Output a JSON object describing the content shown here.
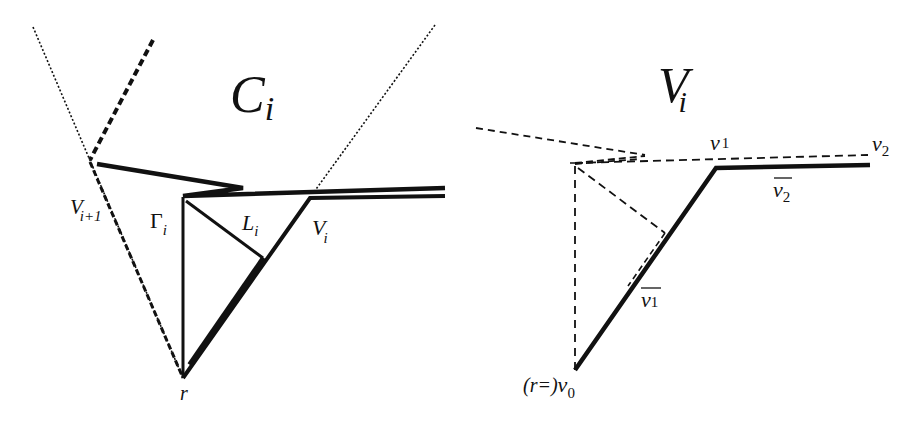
{
  "figure": {
    "left_panel": {
      "region_label": {
        "main": "C",
        "sub": "i"
      },
      "labels": {
        "v_next": {
          "main": "V",
          "sub": "i+1"
        },
        "gamma": {
          "main": "Γ",
          "sub": "i"
        },
        "l": {
          "main": "L",
          "sub": "i"
        },
        "v_i": {
          "main": "V",
          "sub": "i"
        },
        "root": {
          "main": "r"
        }
      }
    },
    "right_panel": {
      "region_label": {
        "main": "V",
        "sub": "i"
      },
      "labels": {
        "v1": {
          "main": "v",
          "sub": "1"
        },
        "v2": {
          "main": "v",
          "sub": "2"
        },
        "v1bar": {
          "main": "v",
          "sub": "1"
        },
        "v2bar": {
          "main": "v",
          "sub": "2"
        },
        "v0": {
          "prefix": "(r=)",
          "main": "v",
          "sub": "0"
        }
      }
    },
    "colors": {
      "ink": "#111111",
      "background": "#ffffff"
    }
  }
}
